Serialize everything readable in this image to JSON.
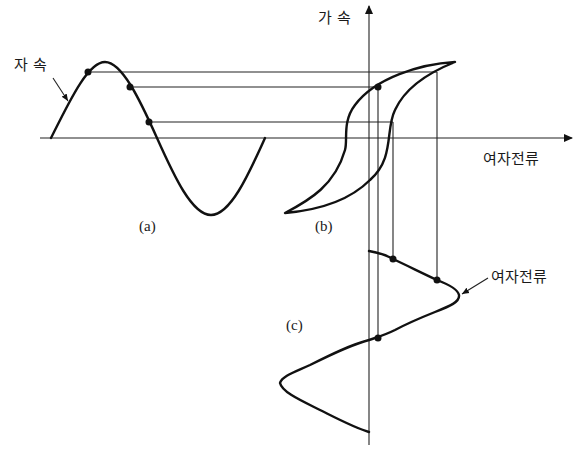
{
  "labels": {
    "flux_left": "자 속",
    "flux_axis": "가 속",
    "current_axis": "여자전류",
    "current_curve": "여자전류",
    "panel_a": "(a)",
    "panel_b": "(b)",
    "panel_c": "(c)"
  },
  "panels": [
    {
      "id": "a",
      "description": "sinusoidal magnetic flux waveform"
    },
    {
      "id": "b",
      "description": "hysteresis loop (flux vs. exciting current)"
    },
    {
      "id": "c",
      "description": "distorted exciting current waveform"
    }
  ],
  "colors": {
    "line": "#111111",
    "background": "#ffffff"
  }
}
